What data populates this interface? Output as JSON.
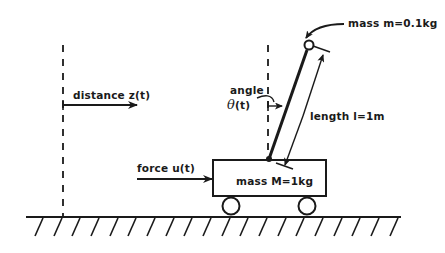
{
  "diagram": {
    "colors": {
      "ink": "#1a1a1a",
      "background": "#ffffff"
    },
    "labels": {
      "mass_pendulum": "mass m=0.1kg",
      "angle_word": "angle",
      "angle_symbol": "θ",
      "angle_arg": "(t)",
      "length": "length l=1m",
      "distance": "distance z(t)",
      "force": "force u(t)",
      "mass_cart": "mass M=1kg"
    },
    "parameters": {
      "pendulum_mass": "0.1kg",
      "cart_mass": "1kg",
      "pendulum_length": "1m"
    }
  }
}
